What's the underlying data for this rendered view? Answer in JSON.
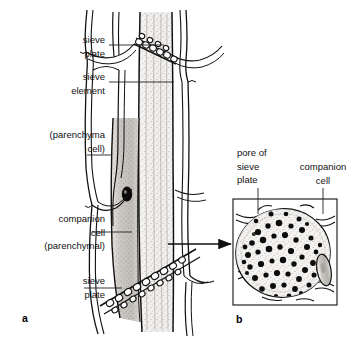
{
  "figure": {
    "background_color": "#ffffff",
    "ink_color": "#111111",
    "shade_color": "#b8b4b0"
  },
  "panel_a": {
    "letter": "a",
    "view": "longitudinal section",
    "labels": [
      {
        "id": "sieve-plate-top",
        "text": "sieve\nplate",
        "align": "right",
        "x": 105,
        "y": 33,
        "leader": {
          "type": "horizontal",
          "x1": 109,
          "y1": 45,
          "x2": 164,
          "y2": 45
        }
      },
      {
        "id": "sieve-element",
        "text": "sieve\nelement",
        "align": "right",
        "x": 105,
        "y": 70,
        "leader": {
          "type": "horizontal",
          "x1": 109,
          "y1": 82,
          "x2": 174,
          "y2": 82
        }
      },
      {
        "id": "parenchyma-cell",
        "text": "(parenchyma\ncell)",
        "align": "right",
        "x": 105,
        "y": 128,
        "leader": {
          "type": "horizontal",
          "x1": 87,
          "y1": 155,
          "x2": 112,
          "y2": 155
        }
      },
      {
        "id": "companion-cell",
        "text": "companion\ncell\n(parenchymal)",
        "align": "right",
        "x": 105,
        "y": 212,
        "leader": {
          "type": "horizontal",
          "x1": 92,
          "y1": 232,
          "x2": 132,
          "y2": 232
        }
      },
      {
        "id": "sieve-plate-low",
        "text": "sieve\nplate",
        "align": "right",
        "x": 105,
        "y": 274,
        "leader": {
          "type": "horizontal",
          "x1": 84,
          "y1": 288,
          "x2": 122,
          "y2": 288
        }
      }
    ]
  },
  "panel_b": {
    "letter": "b",
    "view": "cross section through sieve plate",
    "frame": {
      "x": 233,
      "y": 199,
      "width": 104,
      "height": 106
    },
    "labels": [
      {
        "id": "pore-of-sieve-plate",
        "text": "pore of\nsieve\nplate",
        "align": "left",
        "x": 237,
        "y": 146,
        "leader": {
          "type": "vertical",
          "x1": 258,
          "y1": 188,
          "x2": 258,
          "y2": 214
        }
      },
      {
        "id": "companion-cell",
        "text": "companion\ncell",
        "align": "left",
        "x": 294,
        "y": 160,
        "leader": {
          "type": "vertical",
          "x1": 323,
          "y1": 188,
          "x2": 323,
          "y2": 214
        }
      }
    ],
    "pore_count_visible": 58
  },
  "connector": {
    "id": "panel-a-to-b-arrow",
    "x1": 168,
    "y1": 244,
    "x2": 232,
    "y2": 244,
    "style": "solid arrow pointing right"
  }
}
